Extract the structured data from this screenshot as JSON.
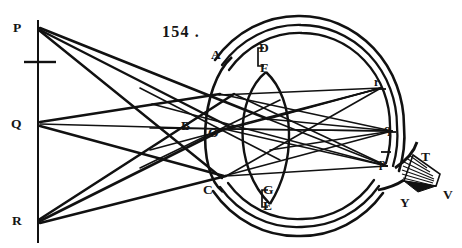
{
  "figure": {
    "number": "154 .",
    "title_absent": true
  },
  "labels": {
    "object_line": [
      {
        "key": "P",
        "text": "P",
        "x": 13,
        "y": 21,
        "size": "cap"
      },
      {
        "key": "Q",
        "text": "Q",
        "x": 11,
        "y": 117,
        "size": "cap"
      },
      {
        "key": "R",
        "text": "R",
        "x": 12,
        "y": 214,
        "size": "cap"
      }
    ],
    "eye": [
      {
        "key": "A",
        "text": "A",
        "x": 211,
        "y": 48,
        "size": "cap"
      },
      {
        "key": "B",
        "text": "B",
        "x": 181,
        "y": 119,
        "size": "cap"
      },
      {
        "key": "C",
        "text": "C",
        "x": 203,
        "y": 183,
        "size": "cap"
      },
      {
        "key": "D",
        "text": "D",
        "x": 259,
        "y": 41,
        "size": "cap"
      },
      {
        "key": "F",
        "text": "F",
        "x": 260,
        "y": 61,
        "size": "cap"
      },
      {
        "key": "O",
        "text": "O",
        "x": 208,
        "y": 126,
        "size": "cap"
      },
      {
        "key": "G",
        "text": "G",
        "x": 263,
        "y": 183,
        "size": "cap"
      },
      {
        "key": "E",
        "text": "E",
        "x": 263,
        "y": 199,
        "size": "cap"
      }
    ],
    "retina_images": [
      {
        "key": "r",
        "text": "r",
        "x": 374,
        "y": 76,
        "size": "min"
      },
      {
        "key": "q",
        "text": "q",
        "x": 384,
        "y": 123,
        "size": "min"
      },
      {
        "key": "p",
        "text": "p",
        "x": 379,
        "y": 157,
        "size": "min"
      }
    ],
    "optic_nerve": [
      {
        "key": "T",
        "text": "T",
        "x": 421,
        "y": 150,
        "size": "cap"
      },
      {
        "key": "V",
        "text": "V",
        "x": 443,
        "y": 188,
        "size": "cap"
      },
      {
        "key": "Y",
        "text": "Y",
        "x": 400,
        "y": 196,
        "size": "cap"
      }
    ]
  },
  "geometry": {
    "object_line": {
      "x": 38,
      "y_top": 20,
      "y_bottom": 243
    },
    "object_tick": {
      "y": 62,
      "x_start": 24,
      "x_end": 56
    },
    "points": {
      "P": {
        "x": 38,
        "y": 27
      },
      "Q": {
        "x": 38,
        "y": 124
      },
      "R": {
        "x": 38,
        "y": 221
      },
      "A": {
        "x": 227,
        "y": 62
      },
      "C": {
        "x": 221,
        "y": 186
      },
      "D": {
        "x": 268,
        "y": 57
      },
      "F": {
        "x": 266,
        "y": 72
      },
      "G": {
        "x": 271,
        "y": 190
      },
      "E": {
        "x": 270,
        "y": 205
      },
      "O": {
        "x": 219,
        "y": 130
      },
      "B": {
        "x": 196,
        "y": 128
      },
      "r": {
        "x": 381,
        "y": 88
      },
      "q": {
        "x": 392,
        "y": 131
      },
      "p": {
        "x": 387,
        "y": 166
      }
    },
    "eyeball": {
      "cx": 307,
      "cy": 126,
      "rx": 104,
      "ry": 110
    },
    "colors": {
      "ink": "#111111",
      "paper": "#ffffff"
    }
  },
  "colors": {
    "ink": "#111111",
    "paper": "#ffffff"
  }
}
